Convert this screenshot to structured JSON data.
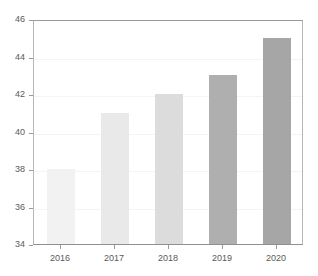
{
  "top_clipped_text": "",
  "chart_data": {
    "type": "bar",
    "title": "",
    "subtitle": "",
    "xlabel": "",
    "ylabel": "",
    "categories": [
      "2016",
      "2017",
      "2018",
      "2019",
      "2020"
    ],
    "values": [
      38,
      41,
      42,
      43,
      45
    ],
    "ylim": [
      34,
      46
    ],
    "yticks": [
      34,
      36,
      38,
      40,
      42,
      44,
      46
    ],
    "ytick_labels": [
      "34",
      "36",
      "38",
      "40",
      "42",
      "44",
      "46"
    ],
    "grid": true,
    "grid_axis": "y",
    "legend": false,
    "legend_position": "none",
    "bar_colors": [
      "#f2f2f2",
      "#e9e9e9",
      "#dcdcdc",
      "#afafaf",
      "#a6a6a6"
    ],
    "series": [
      {
        "name": "",
        "values": [
          38,
          41,
          42,
          43,
          45
        ]
      }
    ],
    "points": [
      {
        "category": "2016",
        "value": 38,
        "color": "#f2f2f2"
      },
      {
        "category": "2017",
        "value": 41,
        "color": "#e9e9e9"
      },
      {
        "category": "2018",
        "value": 42,
        "color": "#dcdcdc"
      },
      {
        "category": "2019",
        "value": 43,
        "color": "#afafaf"
      },
      {
        "category": "2020",
        "value": 45,
        "color": "#a6a6a6"
      }
    ],
    "colors": {
      "background": "#ffffff",
      "frame": "#b5b5b5",
      "gridline": "#f4f4f4",
      "tick_label": "#595959",
      "tick_mark": "#9a9a9a"
    }
  }
}
